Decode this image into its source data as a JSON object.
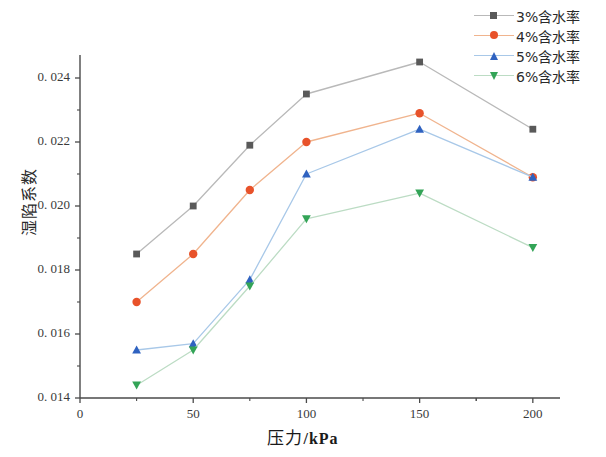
{
  "chart_data": {
    "type": "line",
    "title": "",
    "xlabel": "压力 /kPa",
    "ylabel": "湿陷系数",
    "x": [
      25,
      50,
      75,
      100,
      150,
      200
    ],
    "xlim": [
      0,
      212
    ],
    "ylim": [
      0.014,
      0.0249
    ],
    "xticks": [
      0,
      50,
      100,
      150,
      200
    ],
    "xtick_labels": [
      "0",
      "50",
      "100",
      "150",
      "200"
    ],
    "yticks": [
      0.014,
      0.016,
      0.018,
      0.02,
      0.022,
      0.024
    ],
    "ytick_labels": [
      "0. 014",
      "0. 016",
      "0. 018",
      "0. 020",
      "0. 022",
      "0. 024"
    ],
    "grid": false,
    "legend_position": "top-right",
    "series": [
      {
        "name": "3%含水率",
        "color": "#595959",
        "line_color": "#b9b9b9",
        "marker": "square",
        "values": [
          0.0185,
          0.02,
          0.0219,
          0.0235,
          0.0245,
          0.0224
        ]
      },
      {
        "name": "4%含水率",
        "color": "#e8522a",
        "line_color": "#f0b48e",
        "marker": "circle",
        "values": [
          0.017,
          0.0185,
          0.0205,
          0.022,
          0.0229,
          0.0209
        ]
      },
      {
        "name": "5%含水率",
        "color": "#2f62c0",
        "line_color": "#a8c8e8",
        "marker": "triangle-up",
        "values": [
          0.0155,
          0.0157,
          0.0177,
          0.021,
          0.0224,
          0.0209
        ]
      },
      {
        "name": "6%含水率",
        "color": "#33a457",
        "line_color": "#bcdcc4",
        "marker": "triangle-down",
        "values": [
          0.0144,
          0.0155,
          0.0175,
          0.0196,
          0.0204,
          0.0187
        ]
      }
    ]
  },
  "axis": {
    "x_label_text": "压力",
    "x_label_unit": "/kPa",
    "y_label_text": "湿陷系数"
  }
}
